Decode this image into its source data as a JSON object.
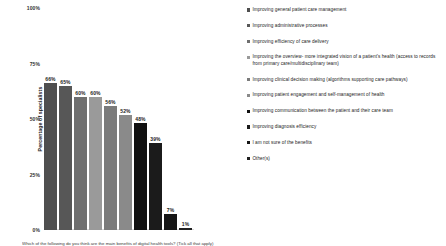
{
  "chart_data": {
    "type": "bar",
    "title": "",
    "xlabel": "",
    "ylabel": "Percentage of specialists",
    "ylim": [
      0,
      100
    ],
    "grid": false,
    "legend_position": "right",
    "ytick_labels": [
      "100%",
      "75%",
      "50%",
      "25%",
      "0%"
    ],
    "ytick_values": [
      100,
      75,
      50,
      25,
      0
    ],
    "categories": [
      "Improving general patient care management",
      "Improving administrative processes",
      "Improving efficiency of care delivery",
      "Improving the overview- more integrated vision of a patient's health (access to records from primary care/multidisciplinary team)",
      "Improving clinical decision making (algorithms supporting care pathways)",
      "Improving patient engagement and self-management of health",
      "Improving communication between the patient and their care team",
      "Improving diagnosis efficiency",
      "I am not sure of the benefits",
      "Other(s)"
    ],
    "values": [
      66,
      65,
      60,
      60,
      56,
      52,
      48,
      39,
      7,
      1
    ],
    "value_labels": [
      "66%",
      "65%",
      "60%",
      "60%",
      "56%",
      "52%",
      "48%",
      "39%",
      "7%",
      "1%"
    ],
    "bar_colors": [
      "#4f4f4f",
      "#575757",
      "#6f6f6f",
      "#9a9a9a",
      "#7b7b7b",
      "#8a8a8a",
      "#111111",
      "#1b1b1b",
      "#161616",
      "#202020"
    ]
  },
  "legend": {
    "items": [
      {
        "label": "Improving general patient care management",
        "color": "#4f4f4f"
      },
      {
        "label": "Improving administrative processes",
        "color": "#575757"
      },
      {
        "label": "Improving efficiency of care delivery",
        "color": "#6f6f6f"
      },
      {
        "label": "Improving the overview- more integrated vision of a patient's health (access to records from primary care/multidisciplinary team)",
        "color": "#9a9a9a"
      },
      {
        "label": "Improving clinical decision making (algorithms supporting care pathways)",
        "color": "#7b7b7b"
      },
      {
        "label": "Improving patient engagement and self-management of health",
        "color": "#8a8a8a"
      },
      {
        "label": "Improving communication between the patient and their care team",
        "color": "#111111"
      },
      {
        "label": "Improving diagnosis efficiency",
        "color": "#1b1b1b"
      },
      {
        "label": "I am not sure of the benefits",
        "color": "#161616"
      },
      {
        "label": "Other(s)",
        "color": "#202020"
      }
    ]
  },
  "caption": {
    "text": "Which of the following do you think are the main benefits of digital health tools? (Tick all that apply)"
  }
}
